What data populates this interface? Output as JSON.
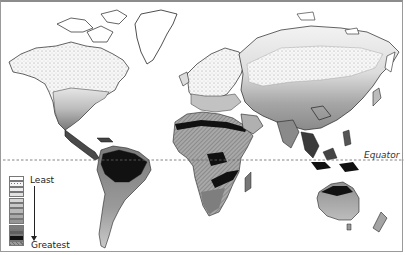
{
  "map": {
    "type": "world choropleth",
    "equator_label": "Equator",
    "legend": {
      "top_label": "Least",
      "bottom_label": "Greatest",
      "classes": [
        {
          "rank": 1,
          "fill": "#ffffff",
          "pattern": "none"
        },
        {
          "rank": 2,
          "fill": "#f4f4f4",
          "pattern": "sparse-dots"
        },
        {
          "rank": 3,
          "fill": "#ececec",
          "pattern": "dense-dots"
        },
        {
          "rank": 4,
          "fill": "#e2e2e2",
          "pattern": "none"
        },
        {
          "rank": 5,
          "fill": "#d6d6d6",
          "pattern": "none"
        },
        {
          "rank": 6,
          "fill": "#c8c8c8",
          "pattern": "none"
        },
        {
          "rank": 7,
          "fill": "#b9b9b9",
          "pattern": "none"
        },
        {
          "rank": 8,
          "fill": "#a9a9a9",
          "pattern": "none"
        },
        {
          "rank": 9,
          "fill": "#969696",
          "pattern": "none"
        },
        {
          "rank": 10,
          "fill": "#7c7c7c",
          "pattern": "none"
        },
        {
          "rank": 11,
          "fill": "#5f5f5f",
          "pattern": "none"
        },
        {
          "rank": 12,
          "fill": "#111111",
          "pattern": "none"
        },
        {
          "rank": 13,
          "fill": "#9a9a9a",
          "pattern": "hatch"
        }
      ]
    },
    "regions": [
      {
        "name": "North America",
        "class_range": "least to medium"
      },
      {
        "name": "Greenland",
        "class_range": "least"
      },
      {
        "name": "Central America",
        "class_range": "high"
      },
      {
        "name": "South America",
        "class_range": "medium to greatest"
      },
      {
        "name": "Europe",
        "class_range": "low to medium"
      },
      {
        "name": "Africa",
        "class_range": "hatched to greatest"
      },
      {
        "name": "Asia",
        "class_range": "least to high"
      },
      {
        "name": "Southeast Asia",
        "class_range": "greatest"
      },
      {
        "name": "Australia",
        "class_range": "medium to greatest"
      },
      {
        "name": "New Zealand",
        "class_range": "medium"
      }
    ]
  }
}
